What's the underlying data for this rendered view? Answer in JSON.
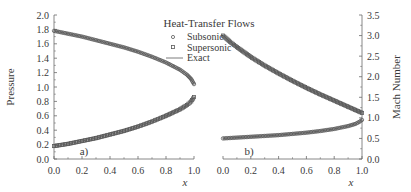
{
  "chart_data": [
    {
      "type": "line",
      "panel_label": "a)",
      "title": "Heat-Transfer Flows",
      "xlabel": "x",
      "ylabel": "Pressure",
      "xlim": [
        0.0,
        1.0
      ],
      "ylim": [
        0.0,
        2.0
      ],
      "xticks": [
        "0.0",
        "0.2",
        "0.4",
        "0.6",
        "0.8",
        "1.0"
      ],
      "yticks": [
        "0.0",
        "0.2",
        "0.4",
        "0.6",
        "0.8",
        "1.0",
        "1.2",
        "1.4",
        "1.6",
        "1.8",
        "2.0"
      ],
      "series": [
        {
          "name": "Subsonic",
          "marker": "circle",
          "x": [
            0.0,
            0.1,
            0.2,
            0.3,
            0.4,
            0.5,
            0.6,
            0.7,
            0.8,
            0.9,
            0.95,
            0.98,
            1.0
          ],
          "values": [
            1.78,
            1.74,
            1.7,
            1.65,
            1.6,
            1.55,
            1.49,
            1.42,
            1.34,
            1.24,
            1.17,
            1.11,
            1.04
          ]
        },
        {
          "name": "Supersonic",
          "marker": "square",
          "x": [
            0.0,
            0.1,
            0.2,
            0.3,
            0.4,
            0.5,
            0.6,
            0.7,
            0.8,
            0.9,
            0.95,
            0.98,
            1.0
          ],
          "values": [
            0.18,
            0.21,
            0.25,
            0.29,
            0.34,
            0.39,
            0.45,
            0.52,
            0.6,
            0.69,
            0.75,
            0.8,
            0.86
          ]
        }
      ]
    },
    {
      "type": "line",
      "panel_label": "b)",
      "xlabel": "x",
      "ylabel": "Mach Number",
      "xlim": [
        0.0,
        1.0
      ],
      "ylim": [
        0.0,
        3.5
      ],
      "xticks": [
        "0.0",
        "0.2",
        "0.4",
        "0.6",
        "0.8",
        "1.0"
      ],
      "yticks": [
        "0.0",
        "0.5",
        "1.0",
        "1.5",
        "2.0",
        "2.5",
        "3.0",
        "3.5"
      ],
      "series": [
        {
          "name": "Subsonic",
          "marker": "circle",
          "x": [
            0.0,
            0.1,
            0.2,
            0.3,
            0.4,
            0.5,
            0.6,
            0.7,
            0.8,
            0.9,
            0.95,
            0.98,
            1.0
          ],
          "values": [
            0.5,
            0.52,
            0.54,
            0.56,
            0.58,
            0.61,
            0.64,
            0.68,
            0.73,
            0.8,
            0.85,
            0.9,
            0.95
          ]
        },
        {
          "name": "Supersonic",
          "marker": "square",
          "x": [
            0.0,
            0.05,
            0.1,
            0.2,
            0.3,
            0.4,
            0.5,
            0.6,
            0.7,
            0.8,
            0.9,
            1.0
          ],
          "values": [
            3.0,
            2.85,
            2.72,
            2.48,
            2.27,
            2.08,
            1.9,
            1.73,
            1.57,
            1.42,
            1.27,
            1.12
          ]
        }
      ]
    }
  ],
  "legend": {
    "title": "Heat-Transfer Flows",
    "items": [
      {
        "label": "Subsonic",
        "symbol": "circle"
      },
      {
        "label": "Supersonic",
        "symbol": "square"
      },
      {
        "label": "Exact",
        "symbol": "line"
      }
    ]
  },
  "labels": {
    "left_ylabel": "Pressure",
    "right_ylabel": "Mach Number",
    "xlabel": "x",
    "panel_a": "a)",
    "panel_b": "b)"
  },
  "colors": {
    "curve": "#5a5a5a",
    "axis": "#6a6a6a",
    "text": "#3a3a3a"
  }
}
